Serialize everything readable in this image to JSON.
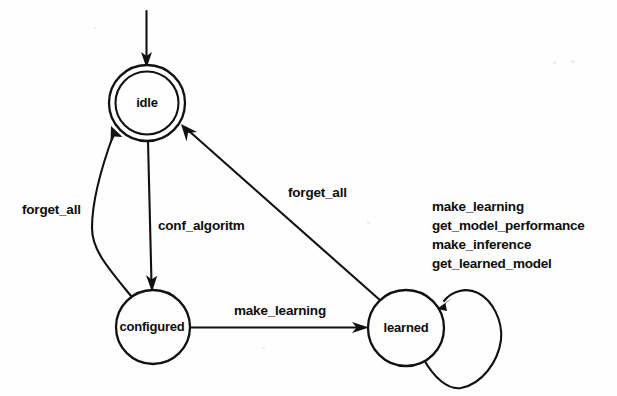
{
  "diagram": {
    "type": "state-machine",
    "title": "",
    "states": [
      {
        "id": "idle",
        "label": "idle",
        "shape": "double-circle",
        "cx": 147,
        "cy": 103,
        "r_outer": 38,
        "r_inner": 32,
        "is_initial": true
      },
      {
        "id": "configured",
        "label": "configured",
        "shape": "circle",
        "cx": 153,
        "cy": 327,
        "r_outer": 37,
        "is_initial": false
      },
      {
        "id": "learned",
        "label": "learned",
        "shape": "circle",
        "cx": 406,
        "cy": 328,
        "r_outer": 38,
        "is_initial": false
      }
    ],
    "initial_arrow": {
      "name": "initial-transition",
      "from": "start",
      "to": "idle"
    },
    "transitions": [
      {
        "id": "configured-to-idle",
        "from": "configured",
        "to": "idle",
        "label": "forget_all",
        "label_x": 22,
        "label_y": 214,
        "style": "curved"
      },
      {
        "id": "idle-to-configured",
        "from": "idle",
        "to": "configured",
        "label": "conf_algoritm",
        "label_x": 158,
        "label_y": 230,
        "style": "straight"
      },
      {
        "id": "learned-to-idle",
        "from": "learned",
        "to": "idle",
        "label": "forget_all",
        "label_x": 288,
        "label_y": 197,
        "style": "straight"
      },
      {
        "id": "configured-to-learned",
        "from": "configured",
        "to": "learned",
        "label": "make_learning",
        "label_x": 234,
        "label_y": 315,
        "style": "straight"
      }
    ],
    "self_loop": {
      "id": "learned-self-loop",
      "state": "learned",
      "label_x": 432,
      "events": [
        "make_learning",
        "get_model_performance",
        "make_inference",
        "get_learned_model"
      ]
    },
    "colors": {
      "background": "#fefefe",
      "ink": "#111111",
      "text": "#0d0d0d"
    }
  }
}
